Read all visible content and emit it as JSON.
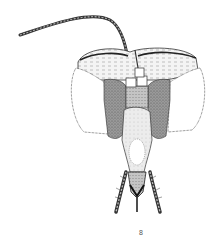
{
  "figure": {
    "label": "8",
    "colors": {
      "ink": "#222222",
      "stipple_dark": "#8a8a8a",
      "stipple_mid": "#b4b4b4",
      "stipple_light": "#d8d8d8",
      "background": "#ffffff"
    }
  }
}
